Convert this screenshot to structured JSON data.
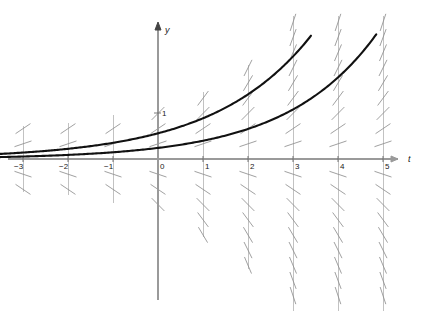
{
  "figure": {
    "background_color": "#ffffff"
  },
  "axes": {
    "x_axis_label": "t",
    "y_axis_label": "y",
    "x_axis_color": "#9a9a9a",
    "y_axis_color": "#9a9a9a",
    "x_ticks": [
      {
        "value": -3,
        "label": "−3"
      },
      {
        "value": -2,
        "label": "−2"
      },
      {
        "value": -1,
        "label": "−1"
      },
      {
        "value": 0,
        "label": "0"
      },
      {
        "value": 1,
        "label": "1"
      },
      {
        "value": 2,
        "label": "2"
      },
      {
        "value": 3,
        "label": "3"
      },
      {
        "value": 4,
        "label": "4"
      },
      {
        "value": 5,
        "label": "5"
      }
    ],
    "y_ticks": [
      {
        "value": 1,
        "label": "1"
      }
    ],
    "tick_label_color": "#1a1a1a"
  },
  "chart_data": {
    "type": "line",
    "xlabel": "t",
    "ylabel": "y",
    "xlim": [
      -3.6,
      5.6
    ],
    "ylim": [
      -3.4,
      3.1
    ],
    "grid": false,
    "legend": "none",
    "slope_field": {
      "equation": "dy/dt = y",
      "mark_color": "#8f8f8f",
      "column_line_color": "#a8a8a8",
      "columns_at_t": [
        -3,
        -2,
        -1,
        0,
        1,
        2,
        3,
        4,
        5
      ],
      "row_spacing_y": 0.33,
      "mark_half_length_px": 9,
      "description": "Short slanted dashes whose slope equals y, drawn in vertical columns at each integer t; columns grow taller to the right."
    },
    "series": [
      {
        "name": "upper solution curve",
        "equation": "y = 0.56 e^{0.46 t}",
        "color": "#111111",
        "line_width": 2.1,
        "points_t": [
          -3.6,
          -3,
          -2,
          -1,
          0,
          1,
          2,
          3,
          3.4
        ],
        "points_y": [
          0.106,
          0.14,
          0.222,
          0.352,
          0.56,
          0.888,
          1.408,
          2.232,
          2.68
        ]
      },
      {
        "name": "lower solution curve",
        "equation": "y = 0.24 e^{0.50 t}",
        "color": "#111111",
        "line_width": 2.1,
        "points_t": [
          -3.6,
          -3,
          -2,
          -1,
          0,
          1,
          2,
          3,
          4,
          4.85
        ],
        "points_y": [
          0.04,
          0.054,
          0.088,
          0.146,
          0.24,
          0.396,
          0.653,
          1.076,
          1.774,
          2.71
        ]
      }
    ]
  }
}
